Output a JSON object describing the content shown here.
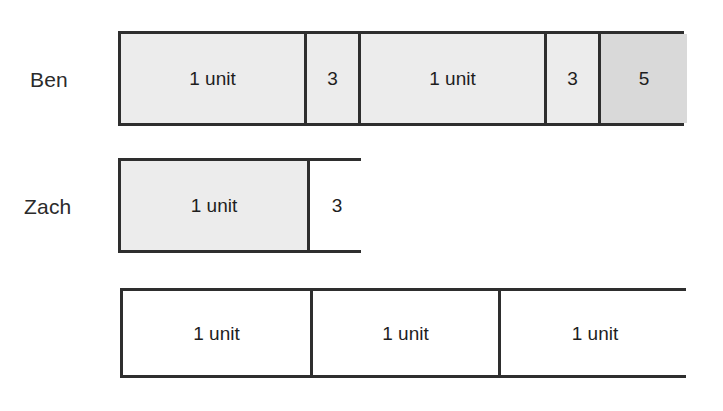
{
  "figure": {
    "type": "tape-diagram",
    "background_color": "#ffffff",
    "line_color": "#2e2e2e",
    "fill_gray": "#ececec",
    "fill_gray_dark": "#d9d9d9",
    "fill_white": "#ffffff"
  },
  "rows": [
    {
      "label": "Ben",
      "has_label": true,
      "bar": {
        "x": 118,
        "y": 31,
        "width": 566,
        "height": 95,
        "cells": [
          {
            "text": "1 unit",
            "width": 186,
            "fill": "fill-gray"
          },
          {
            "text": "3",
            "width": 54,
            "fill": "fill-gray"
          },
          {
            "text": "1 unit",
            "width": 186,
            "fill": "fill-gray"
          },
          {
            "text": "3",
            "width": 54,
            "fill": "fill-gray"
          },
          {
            "text": "5",
            "width": 86,
            "fill": "fill-gray-dark"
          }
        ]
      },
      "label_pos": {
        "x": 30,
        "y": 69
      }
    },
    {
      "label": "Zach",
      "has_label": true,
      "bar": {
        "x": 118,
        "y": 158,
        "width": 243,
        "height": 95,
        "cells": [
          {
            "text": "1 unit",
            "width": 189,
            "fill": "fill-gray"
          },
          {
            "text": "3",
            "width": 54,
            "fill": "fill-white"
          }
        ]
      },
      "label_pos": {
        "x": 24,
        "y": 196
      }
    },
    {
      "label": "",
      "has_label": false,
      "bar": {
        "x": 120,
        "y": 288,
        "width": 566,
        "height": 90,
        "cells": [
          {
            "text": "1 unit",
            "width": 190,
            "fill": "fill-white"
          },
          {
            "text": "1 unit",
            "width": 188,
            "fill": "fill-white"
          },
          {
            "text": "1 unit",
            "width": 188,
            "fill": "fill-white"
          }
        ]
      },
      "label_pos": {
        "x": 0,
        "y": 0
      }
    }
  ],
  "chart_data": {
    "type": "bar",
    "title": "",
    "xlabel": "",
    "ylabel": "",
    "categories": [
      "Ben",
      "Zach",
      "(reference)"
    ],
    "series": [
      {
        "name": "Ben",
        "segments": [
          "1 unit",
          "3",
          "1 unit",
          "3",
          "5"
        ]
      },
      {
        "name": "Zach",
        "segments": [
          "1 unit",
          "3"
        ]
      },
      {
        "name": "(reference)",
        "segments": [
          "1 unit",
          "1 unit",
          "1 unit"
        ]
      }
    ]
  }
}
